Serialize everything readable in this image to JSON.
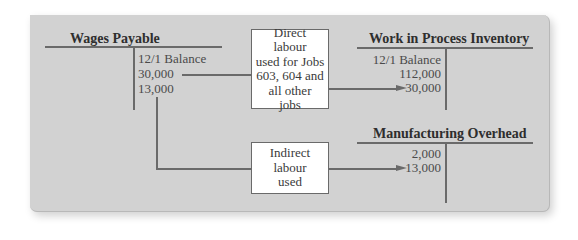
{
  "diagram": {
    "accounts": {
      "wages_payable": {
        "title": "Wages Payable",
        "credit_entries": [
          "12/1 Balance",
          "30,000",
          "13,000"
        ]
      },
      "wip_inventory": {
        "title": "Work in Process Inventory",
        "debit_entries": [
          "12/1 Balance",
          "112,000",
          "30,000"
        ]
      },
      "manufacturing_overhead": {
        "title": "Manufacturing Overhead",
        "debit_entries": [
          "2,000",
          "13,000"
        ]
      }
    },
    "boxes": {
      "direct_labour": {
        "lines": [
          "Direct",
          "labour",
          "used for Jobs",
          "603, 604 and",
          "all other",
          "jobs"
        ]
      },
      "indirect_labour": {
        "lines": [
          "Indirect",
          "labour",
          "used"
        ]
      }
    },
    "colors": {
      "panel_background": "#d2d2d2",
      "line": "#6a6a6a",
      "box_background": "#ffffff"
    }
  }
}
